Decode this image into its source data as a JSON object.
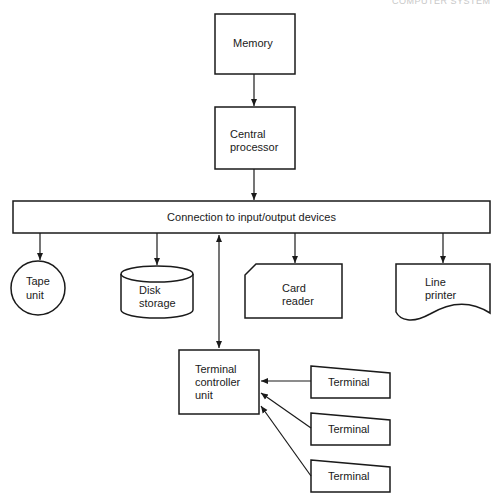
{
  "header": {
    "cut_text": "COMPUTER SYSTEM"
  },
  "diagram": {
    "nodes": {
      "memory": {
        "label": "Memory",
        "shape": "rectangle"
      },
      "cpu": {
        "label_line1": "Central",
        "label_line2": "processor",
        "shape": "rectangle"
      },
      "bus": {
        "label": "Connection to input/output devices",
        "shape": "wide-rectangle"
      },
      "tape": {
        "label_line1": "Tape",
        "label_line2": "unit",
        "shape": "circle"
      },
      "disk": {
        "label_line1": "Disk",
        "label_line2": "storage",
        "shape": "cylinder"
      },
      "card": {
        "label_line1": "Card",
        "label_line2": "reader",
        "shape": "punched-card"
      },
      "printer": {
        "label_line1": "Line",
        "label_line2": "printer",
        "shape": "document"
      },
      "controller": {
        "label_line1": "Terminal",
        "label_line2": "controller",
        "label_line3": "unit",
        "shape": "rectangle"
      },
      "terminals": [
        {
          "label": "Terminal",
          "shape": "manual-input"
        },
        {
          "label": "Terminal",
          "shape": "manual-input"
        },
        {
          "label": "Terminal",
          "shape": "manual-input"
        }
      ]
    },
    "edges": [
      {
        "from": "memory",
        "to": "cpu"
      },
      {
        "from": "cpu",
        "to": "bus"
      },
      {
        "from": "bus",
        "to": "tape"
      },
      {
        "from": "bus",
        "to": "disk"
      },
      {
        "from": "bus",
        "to": "card"
      },
      {
        "from": "bus",
        "to": "printer"
      },
      {
        "from": "bus",
        "to": "controller",
        "bidirectional": true
      },
      {
        "from": "terminal-1",
        "to": "controller"
      },
      {
        "from": "terminal-2",
        "to": "controller"
      },
      {
        "from": "terminal-3",
        "to": "controller"
      }
    ]
  }
}
